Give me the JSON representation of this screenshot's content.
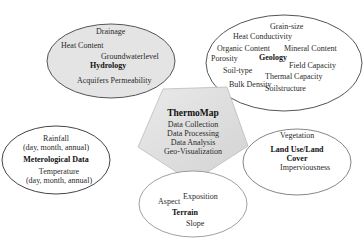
{
  "diagram": {
    "center": {
      "title": "ThermoMap",
      "items": [
        "Data Collection",
        "Data Processing",
        "Data Analysis",
        "Geo-Visualization"
      ]
    },
    "hydrology": {
      "title": "Hydrology",
      "items": [
        "Drainage",
        "Heat Content",
        "Groundwaterlevel",
        "Acquifers Permeability"
      ]
    },
    "geology": {
      "title": "Geology",
      "items": [
        "Grain-size",
        "Heat Conductivity",
        "Organic Content",
        "Mineral Content",
        "Porosity",
        "Field Capacity",
        "Soil-type",
        "Thermal Capacity",
        "Bulk Density",
        "Soilstructure"
      ]
    },
    "meteorological": {
      "title": "Meterological Data",
      "items": [
        "Rainfall",
        "(day, month, annual)",
        "Temperature",
        "(day, month, annual)"
      ]
    },
    "landuse": {
      "title_line1": "Land Use/Land",
      "title_line2": "Cover",
      "items": [
        "Vegetation",
        "Imperviousness"
      ]
    },
    "terrain": {
      "title": "Terrain",
      "items": [
        "Aspect",
        "Exposition",
        "Slope"
      ]
    },
    "colors": {
      "shaded_fill": "#e4e4e4",
      "pentagon_fill": "#dcdcdc",
      "outline": "#555555",
      "white_fill": "#ffffff"
    }
  }
}
